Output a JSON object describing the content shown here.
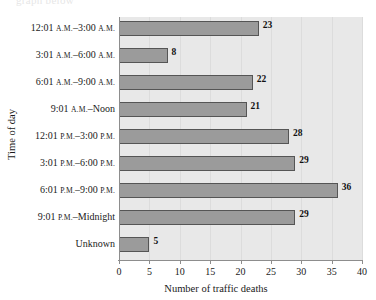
{
  "page": {
    "remnant_text": "graph below"
  },
  "chart_data": {
    "type": "bar",
    "orientation": "horizontal",
    "title": "",
    "xlabel": "Number of traffic deaths",
    "ylabel": "Time of day",
    "categories": [
      "12:01 A.M.–3:00 A.M.",
      "3:01 A.M.–6:00 A.M.",
      "6:01 A.M.–9:00 A.M.",
      "9:01 A.M.–Noon",
      "12:01 P.M.–3:00 P.M.",
      "3:01 P.M.–6:00 P.M.",
      "6:01 P.M.–9:00 P.M.",
      "9:01 P.M.–Midnight",
      "Unknown"
    ],
    "category_parts": [
      {
        "t1": "12:01 ",
        "sc1": "A.M.",
        "t2": "–3:00 ",
        "sc2": "A.M."
      },
      {
        "t1": "3:01 ",
        "sc1": "A.M.",
        "t2": "–6:00 ",
        "sc2": "A.M."
      },
      {
        "t1": "6:01 ",
        "sc1": "A.M.",
        "t2": "–9:00 ",
        "sc2": "A.M."
      },
      {
        "t1": "9:01 ",
        "sc1": "A.M.",
        "t2": "–Noon",
        "sc2": ""
      },
      {
        "t1": "12:01 ",
        "sc1": "P.M.",
        "t2": "–3:00 ",
        "sc2": "P.M."
      },
      {
        "t1": "3:01 ",
        "sc1": "P.M.",
        "t2": "–6:00 ",
        "sc2": "P.M."
      },
      {
        "t1": "6:01 ",
        "sc1": "P.M.",
        "t2": "–9:00 ",
        "sc2": "P.M."
      },
      {
        "t1": "9:01 ",
        "sc1": "P.M.",
        "t2": "–Midnight",
        "sc2": ""
      },
      {
        "t1": "Unknown",
        "sc1": "",
        "t2": "",
        "sc2": ""
      }
    ],
    "values": [
      23,
      8,
      22,
      21,
      28,
      29,
      36,
      29,
      5
    ],
    "xlim": [
      0,
      40
    ],
    "xticks": [
      0,
      5,
      10,
      15,
      20,
      25,
      30,
      35,
      40
    ],
    "xtick_labels": [
      "0",
      "5",
      "10",
      "15",
      "20",
      "25",
      "30",
      "35",
      "40"
    ],
    "grid": "vertical",
    "legend": "none",
    "colors": {
      "bar_fill": "#9b9b9b",
      "bar_border": "#555555",
      "plot_background": "#e8e8e8",
      "gridline": "#dcdcdc",
      "axis": "#8d8d8d",
      "text": "#1a1a1a"
    }
  }
}
